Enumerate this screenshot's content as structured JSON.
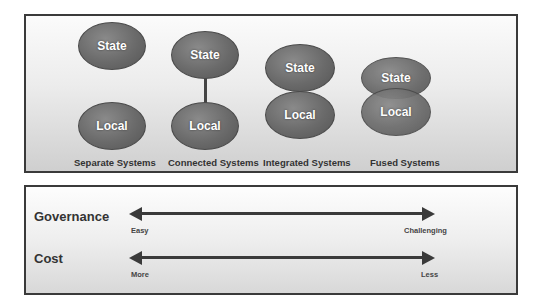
{
  "diagram": {
    "models": [
      {
        "caption": "Separate Systems",
        "top": "State",
        "bottom": "Local",
        "relation": "separate"
      },
      {
        "caption": "Connected Systems",
        "top": "State",
        "bottom": "Local",
        "relation": "connected"
      },
      {
        "caption": "Integrated Systems",
        "top": "State",
        "bottom": "Local",
        "relation": "touching"
      },
      {
        "caption": "Fused Systems",
        "top": "State",
        "bottom": "Local",
        "relation": "overlapping"
      }
    ]
  },
  "scales": [
    {
      "label": "Governance",
      "left": "Easy",
      "right": "Challenging"
    },
    {
      "label": "Cost",
      "left": "More",
      "right": "Less"
    }
  ],
  "colors": {
    "ellipse": "#6a6a6a",
    "border": "#3a3a3a",
    "arrow": "#3a3a3a"
  }
}
